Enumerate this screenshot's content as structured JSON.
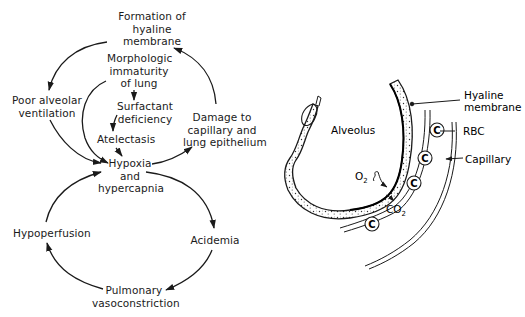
{
  "cycle_diagram": {
    "nodes": {
      "hyaline_formation": [
        "Formation of",
        "hyaline",
        "membrane"
      ],
      "immaturity": [
        "Morphologic",
        "immaturity",
        "of lung"
      ],
      "surfactant": [
        "Surfactant",
        "deficiency"
      ],
      "atelectasis": [
        "Atelectasis"
      ],
      "poor_ventilation": [
        "Poor alveolar",
        "ventilation"
      ],
      "damage": [
        "Damage to",
        "capillary and",
        "lung epithelium"
      ],
      "hypoxia": [
        "Hypoxia",
        "and",
        "hypercapnia"
      ],
      "hypoperfusion": [
        "Hypoperfusion"
      ],
      "acidemia": [
        "Acidemia"
      ],
      "vasoconstriction": [
        "Pulmonary",
        "vasoconstriction"
      ]
    },
    "edges": [
      {
        "from": "hyaline_formation",
        "to": "poor_ventilation"
      },
      {
        "from": "poor_ventilation",
        "to": "hypoxia"
      },
      {
        "from": "immaturity",
        "to": "surfactant"
      },
      {
        "from": "immaturity",
        "to": "hypoxia"
      },
      {
        "from": "surfactant",
        "to": "atelectasis"
      },
      {
        "from": "atelectasis",
        "to": "hypoxia"
      },
      {
        "from": "hypoxia",
        "to": "damage"
      },
      {
        "from": "damage",
        "to": "hyaline_formation"
      },
      {
        "from": "hypoxia",
        "to": "acidemia"
      },
      {
        "from": "acidemia",
        "to": "vasoconstriction"
      },
      {
        "from": "vasoconstriction",
        "to": "hypoperfusion"
      },
      {
        "from": "hypoperfusion",
        "to": "hypoxia"
      }
    ]
  },
  "alveolus_diagram": {
    "labels": {
      "alveolus": "Alveolus",
      "hyaline_membrane": [
        "Hyaline",
        "membrane"
      ],
      "rbc": "RBC",
      "capillary": "Capillary",
      "o2": "O",
      "o2_sub": "2",
      "co2": "CO",
      "co2_sub": "2",
      "rbc_glyph": "C"
    }
  }
}
